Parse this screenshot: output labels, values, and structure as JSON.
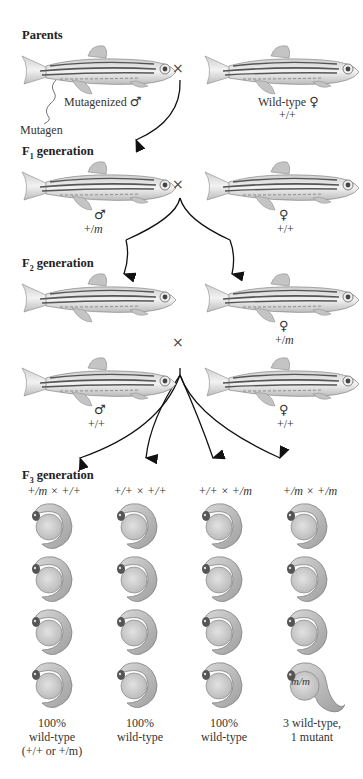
{
  "parents": {
    "heading": "Parents",
    "male_label": "Mutagenized",
    "male_symbol": "♂",
    "female_label": "Wild-type",
    "female_symbol": "♀",
    "female_genotype": "+/+",
    "mutagen_label": "Mutagen",
    "cross_symbol": "×"
  },
  "f1": {
    "heading_prefix": "F",
    "heading_sub": "1",
    "heading_suffix": " generation",
    "male_symbol": "♂",
    "male_genotype_plus": "+/",
    "male_genotype_m": "m",
    "female_symbol": "♀",
    "female_genotype": "+/+",
    "cross_symbol": "×"
  },
  "f2": {
    "heading_prefix": "F",
    "heading_sub": "2",
    "heading_suffix": " generation",
    "female_symbol": "♀",
    "female_genotype_plus": "+/",
    "female_genotype_m": "m",
    "cross_symbol": "×",
    "male2_symbol": "♂",
    "male2_genotype": "+/+",
    "female2_symbol": "♀",
    "female2_genotype": "+/+"
  },
  "f3": {
    "heading_prefix": "F",
    "heading_sub": "3",
    "heading_suffix": " generation",
    "columns": [
      {
        "cross": "+/m × +/+",
        "result_line1": "100%",
        "result_line2": "wild-type",
        "result_line3": "(+/+ or +/m)"
      },
      {
        "cross": "+/+ × +/+",
        "result_line1": "100%",
        "result_line2": "wild-type",
        "result_line3": ""
      },
      {
        "cross": "+/+ × +/m",
        "result_line1": "100%",
        "result_line2": "wild-type",
        "result_line3": ""
      },
      {
        "cross": "+/m × +/m",
        "result_line1": "3 wild-type,",
        "result_line2": "1 mutant",
        "result_line3": ""
      }
    ],
    "mutant_label": "m/m"
  },
  "colors": {
    "fish_body": "#d9d9d9",
    "fish_stripe": "#555555",
    "embryo_yolk": "#d4d4d4",
    "embryo_body": "#bdbdbd",
    "arrow": "#111111"
  }
}
